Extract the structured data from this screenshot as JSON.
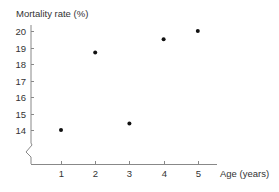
{
  "chart_data": {
    "type": "scatter",
    "title": "",
    "ylabel": "Mortality rate (%)",
    "xlabel": "Age (years)",
    "x_ticks": [
      1,
      2,
      3,
      4,
      5
    ],
    "y_ticks": [
      14,
      15,
      16,
      17,
      18,
      19,
      20
    ],
    "xlim": [
      0,
      5.6
    ],
    "ylim": [
      13,
      20
    ],
    "y_axis_break": true,
    "grid": false,
    "legend": null,
    "series": [
      {
        "name": "Mortality rate",
        "points": [
          {
            "x": 1,
            "y": 14.0
          },
          {
            "x": 2,
            "y": 18.7
          },
          {
            "x": 3,
            "y": 14.4
          },
          {
            "x": 4,
            "y": 19.5
          },
          {
            "x": 5,
            "y": 20.0
          }
        ]
      }
    ]
  },
  "colors": {
    "axis": "#888888",
    "points": "#111111",
    "text": "#333333"
  }
}
